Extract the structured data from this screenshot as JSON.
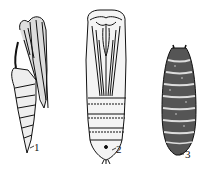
{
  "figure": {
    "type": "line-drawing",
    "background": "#ffffff",
    "ink": "#111111",
    "specimens": [
      {
        "id": "1",
        "label": "1",
        "description": "exarate pupa, side view, free appendages"
      },
      {
        "id": "2",
        "label": "2",
        "description": "obtect pupa, ventral view, appendages fused to body"
      },
      {
        "id": "3",
        "label": "3",
        "description": "coarctate pupa (puparium), barrel-shaped segmented case"
      }
    ]
  }
}
